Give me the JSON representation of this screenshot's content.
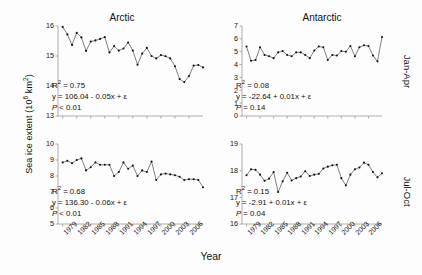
{
  "figure": {
    "ylabel": "Sea ice extent (10",
    "ylabel_sup": "6",
    "ylabel_tail": " km",
    "ylabel_sup2": "2",
    "ylabel_end": ")",
    "xlabel": "Year",
    "column_titles": [
      "Arctic",
      "Antarctic"
    ],
    "row_labels": [
      "Jan-Apr",
      "Jul-Oct"
    ]
  },
  "chart_data": [
    {
      "id": "arctic-jan-apr",
      "type": "line",
      "title": "Arctic",
      "panel": "top-left",
      "season": "Jan-Apr",
      "xlabel": "Year",
      "ylabel": "Sea ice extent (10^6 km^2)",
      "xlim": [
        1978,
        2009
      ],
      "ylim": [
        13,
        16
      ],
      "yticks": [
        13,
        14,
        15,
        16
      ],
      "xticks": [
        1979,
        1982,
        1985,
        1988,
        1991,
        1994,
        1997,
        2000,
        2003,
        2006
      ],
      "grid": false,
      "marker": "filled-circle",
      "x": [
        1979,
        1980,
        1981,
        1982,
        1983,
        1984,
        1985,
        1986,
        1987,
        1988,
        1989,
        1990,
        1991,
        1992,
        1993,
        1994,
        1995,
        1996,
        1997,
        1998,
        1999,
        2000,
        2001,
        2002,
        2003,
        2004,
        2005,
        2006,
        2007,
        2008,
        2009
      ],
      "values": [
        15.97,
        15.72,
        15.37,
        15.77,
        15.62,
        15.17,
        15.48,
        15.52,
        15.57,
        15.63,
        15.12,
        15.33,
        15.18,
        15.25,
        15.45,
        15.18,
        14.71,
        15.08,
        15.27,
        15.0,
        14.92,
        15.03,
        14.99,
        14.92,
        14.66,
        14.23,
        14.13,
        14.33,
        14.68,
        14.7,
        14.62
      ],
      "annotations": {
        "r2": "R2 = 0.75",
        "equation": "y = 106.04 - 0.05x + e",
        "pvalue": "P < 0.01"
      }
    },
    {
      "id": "antarctic-jan-apr",
      "type": "line",
      "title": "Antarctic",
      "panel": "top-right",
      "season": "Jan-Apr",
      "xlabel": "Year",
      "ylabel": "Sea ice extent (10^6 km^2)",
      "xlim": [
        1978,
        2009
      ],
      "ylim": [
        0,
        7
      ],
      "yticks": [
        0,
        1,
        2,
        3,
        4,
        5,
        6,
        7
      ],
      "xticks": [
        1979,
        1982,
        1985,
        1988,
        1991,
        1994,
        1997,
        2000,
        2003,
        2006
      ],
      "grid": false,
      "marker": "filled-circle",
      "x": [
        1979,
        1980,
        1981,
        1982,
        1983,
        1984,
        1985,
        1986,
        1987,
        1988,
        1989,
        1990,
        1991,
        1992,
        1993,
        1994,
        1995,
        1996,
        1997,
        1998,
        1999,
        2000,
        2001,
        2002,
        2003,
        2004,
        2005,
        2006,
        2007,
        2008,
        2009
      ],
      "values": [
        5.4,
        4.3,
        4.35,
        5.35,
        4.75,
        4.65,
        4.5,
        4.95,
        5.05,
        4.75,
        4.65,
        4.95,
        4.95,
        4.75,
        4.5,
        5.1,
        5.4,
        5.35,
        4.35,
        4.75,
        4.7,
        5.05,
        5.0,
        5.45,
        4.65,
        5.35,
        5.5,
        5.45,
        4.7,
        4.25,
        6.15
      ],
      "annotations": {
        "r2": "R2 = 0.08",
        "equation": "y = -22.64 + 0.01x + e",
        "pvalue": "P = 0.14"
      }
    },
    {
      "id": "arctic-jul-oct",
      "type": "line",
      "title": "Arctic",
      "panel": "bottom-left",
      "season": "Jul-Oct",
      "xlabel": "Year",
      "ylabel": "Sea ice extent (10^6 km^2)",
      "xlim": [
        1978,
        2009
      ],
      "ylim": [
        5,
        10
      ],
      "yticks": [
        5,
        6,
        7,
        8,
        9,
        10
      ],
      "xticks": [
        1979,
        1982,
        1985,
        1988,
        1991,
        1994,
        1997,
        2000,
        2003,
        2006
      ],
      "grid": false,
      "marker": "filled-circle",
      "x": [
        1979,
        1980,
        1981,
        1982,
        1983,
        1984,
        1985,
        1986,
        1987,
        1988,
        1989,
        1990,
        1991,
        1992,
        1993,
        1994,
        1995,
        1996,
        1997,
        1998,
        1999,
        2000,
        2001,
        2002,
        2003,
        2004,
        2005,
        2006,
        2007,
        2008,
        2009
      ],
      "values": [
        8.85,
        8.95,
        8.8,
        9.0,
        9.1,
        8.35,
        8.55,
        8.85,
        8.7,
        8.7,
        8.7,
        8.0,
        8.25,
        8.85,
        8.45,
        8.65,
        8.0,
        8.35,
        8.25,
        8.9,
        7.75,
        8.1,
        8.15,
        8.1,
        8.05,
        7.95,
        7.75,
        7.8,
        7.8,
        7.75,
        7.3
      ],
      "annotations": {
        "r2": "R2 = 0.68",
        "equation": "y = 136.30 - 0.06x + e",
        "pvalue": "P < 0.01"
      }
    },
    {
      "id": "antarctic-jul-oct",
      "type": "line",
      "title": "Antarctic",
      "panel": "bottom-right",
      "season": "Jul-Oct",
      "xlabel": "Year",
      "ylabel": "Sea ice extent (10^6 km^2)",
      "xlim": [
        1978,
        2009
      ],
      "ylim": [
        16,
        19
      ],
      "yticks": [
        16,
        17,
        18,
        19
      ],
      "xticks": [
        1979,
        1982,
        1985,
        1988,
        1991,
        1994,
        1997,
        2000,
        2003,
        2006
      ],
      "grid": false,
      "marker": "filled-circle",
      "x": [
        1979,
        1980,
        1981,
        1982,
        1983,
        1984,
        1985,
        1986,
        1987,
        1988,
        1989,
        1990,
        1991,
        1992,
        1993,
        1994,
        1995,
        1996,
        1997,
        1998,
        1999,
        2000,
        2001,
        2002,
        2003,
        2004,
        2005,
        2006,
        2007,
        2008,
        2009
      ],
      "values": [
        17.83,
        18.05,
        18.03,
        17.85,
        17.62,
        17.7,
        17.95,
        17.2,
        17.6,
        17.92,
        17.63,
        17.72,
        17.78,
        17.98,
        17.8,
        17.85,
        17.88,
        18.08,
        18.15,
        18.2,
        18.22,
        17.72,
        17.45,
        17.85,
        18.05,
        18.12,
        18.3,
        18.22,
        17.95,
        17.75,
        17.9
      ],
      "annotations": {
        "r2": "R2 = 0.15",
        "equation": "y = -2.91 + 0.01x + e",
        "pvalue": "P = 0.04"
      }
    }
  ],
  "annotations": {
    "tl": {
      "r2_pre": "R",
      "r2_sup": "2",
      "r2_post": " = 0.75",
      "eq": "y = 106.04 - 0.05x + ε",
      "p_ital": "P",
      "p_rest": " < 0.01"
    },
    "tr": {
      "r2_pre": "R",
      "r2_sup": "2",
      "r2_post": " = 0.08",
      "eq": "y = -22.64 + 0.01x + ε",
      "p_ital": "P",
      "p_rest": " = 0.14"
    },
    "bl": {
      "r2_pre": "R",
      "r2_sup": "2",
      "r2_post": " = 0.68",
      "eq": "y = 136.30 - 0.06x + ε",
      "p_ital": "P",
      "p_rest": " < 0.01"
    },
    "br": {
      "r2_pre": "R",
      "r2_sup": "2",
      "r2_post": " = 0.15",
      "eq": "y = -2.91 + 0.01x + ε",
      "p_ital": "P",
      "p_rest": " = 0.04"
    }
  },
  "style": {
    "line_color": "#4a4a4a",
    "marker_color": "#111111",
    "axis_color": "#999999",
    "background": "#fdfdfd"
  }
}
